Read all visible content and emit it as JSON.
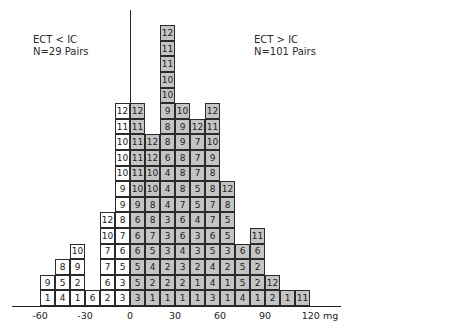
{
  "labels": {
    "left": {
      "line1": "ECT < IC",
      "line2": "N=29 Pairs"
    },
    "right": {
      "line1": "ECT > IC",
      "line2": "N=101 Pairs"
    }
  },
  "colors": {
    "negative_fill": "#ffffff",
    "positive_fill": "#c4c4c4",
    "border": "#2b2b2b"
  },
  "chart_data": {
    "type": "bar",
    "title": "",
    "xlabel": "mg",
    "ylabel": "",
    "xlim": [
      -60,
      120
    ],
    "bin_width": 10,
    "x_ticks": [
      "-60",
      "-30",
      "0",
      "30",
      "60",
      "90",
      "120 mg"
    ],
    "tick_values": [
      -60,
      -30,
      0,
      30,
      60,
      90,
      120
    ],
    "legend": [
      {
        "name": "ECT < IC",
        "n": "N=29 Pairs",
        "fill": "white"
      },
      {
        "name": "ECT > IC",
        "n": "N=101 Pairs",
        "fill": "gray"
      }
    ],
    "bins": [
      {
        "from": -60,
        "to": -50,
        "group": "neg",
        "cells_top_to_bottom": [
          9,
          1
        ]
      },
      {
        "from": -50,
        "to": -40,
        "group": "neg",
        "cells_top_to_bottom": [
          8,
          5,
          4
        ]
      },
      {
        "from": -40,
        "to": -30,
        "group": "neg",
        "cells_top_to_bottom": [
          10,
          9,
          2,
          1
        ]
      },
      {
        "from": -30,
        "to": -20,
        "group": "neg",
        "cells_top_to_bottom": [
          6
        ]
      },
      {
        "from": -20,
        "to": -10,
        "group": "neg",
        "cells_top_to_bottom": [
          12,
          10,
          7,
          7,
          6,
          2
        ]
      },
      {
        "from": -10,
        "to": 0,
        "group": "neg",
        "cells_top_to_bottom": [
          12,
          11,
          10,
          10,
          10,
          9,
          9,
          8,
          7,
          6,
          5,
          3,
          3
        ]
      },
      {
        "from": 0,
        "to": 10,
        "group": "pos",
        "cells_top_to_bottom": [
          12,
          11,
          11,
          11,
          11,
          10,
          9,
          6,
          6,
          6,
          5,
          5,
          3
        ]
      },
      {
        "from": 10,
        "to": 20,
        "group": "pos",
        "cells_top_to_bottom": [
          12,
          12,
          10,
          10,
          8,
          8,
          7,
          5,
          4,
          2,
          1
        ]
      },
      {
        "from": 20,
        "to": 30,
        "group": "pos",
        "cells_top_to_bottom": [
          12,
          11,
          11,
          10,
          10,
          9,
          8,
          8,
          6,
          4,
          4,
          4,
          3,
          3,
          3,
          2,
          2,
          1
        ]
      },
      {
        "from": 30,
        "to": 40,
        "group": "pos",
        "cells_top_to_bottom": [
          10,
          9,
          9,
          8,
          8,
          8,
          7,
          6,
          6,
          4,
          3,
          2,
          1
        ]
      },
      {
        "from": 40,
        "to": 50,
        "group": "pos",
        "cells_top_to_bottom": [
          12,
          7,
          7,
          7,
          5,
          5,
          4,
          3,
          3,
          2,
          1,
          1
        ]
      },
      {
        "from": 50,
        "to": 60,
        "group": "pos",
        "cells_top_to_bottom": [
          12,
          11,
          10,
          9,
          8,
          8,
          7,
          7,
          6,
          5,
          4,
          4,
          3
        ]
      },
      {
        "from": 60,
        "to": 70,
        "group": "pos",
        "cells_top_to_bottom": [
          12,
          8,
          5,
          5,
          3,
          2,
          1,
          1
        ]
      },
      {
        "from": 70,
        "to": 80,
        "group": "pos",
        "cells_top_to_bottom": [
          6,
          5,
          5,
          4
        ]
      },
      {
        "from": 80,
        "to": 90,
        "group": "pos",
        "cells_top_to_bottom": [
          11,
          6,
          2,
          2,
          1
        ]
      },
      {
        "from": 90,
        "to": 100,
        "group": "pos",
        "cells_top_to_bottom": [
          12,
          2
        ]
      },
      {
        "from": 100,
        "to": 110,
        "group": "pos",
        "cells_top_to_bottom": [
          1
        ]
      },
      {
        "from": 110,
        "to": 120,
        "group": "pos",
        "cells_top_to_bottom": [
          11
        ]
      }
    ],
    "categories": [
      "-60",
      "-50",
      "-40",
      "-30",
      "-20",
      "-10",
      "0",
      "10",
      "20",
      "30",
      "40",
      "50",
      "60",
      "70",
      "80",
      "90",
      "100",
      "110"
    ],
    "series": [
      {
        "name": "ECT < IC",
        "values": [
          2,
          3,
          4,
          1,
          6,
          13,
          0,
          0,
          0,
          0,
          0,
          0,
          0,
          0,
          0,
          0,
          0,
          0
        ]
      },
      {
        "name": "ECT > IC",
        "values": [
          0,
          0,
          0,
          0,
          0,
          0,
          13,
          11,
          18,
          13,
          12,
          13,
          8,
          4,
          5,
          2,
          1,
          1
        ]
      }
    ]
  }
}
